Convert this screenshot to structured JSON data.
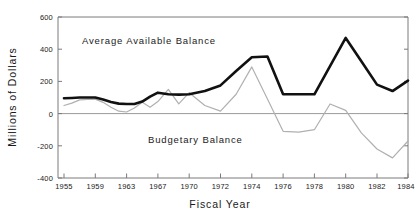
{
  "chart_data": {
    "type": "line",
    "title": "",
    "xlabel": "Fiscal Year",
    "ylabel": "Millions of Dollars",
    "xlim": [
      1955,
      1984
    ],
    "ylim": [
      -400,
      600
    ],
    "grid": false,
    "legend_position": "inline-annotations",
    "y_ticks": [
      600,
      400,
      200,
      0,
      -200,
      -400
    ],
    "y_tick_labels": [
      "600",
      "400",
      "200",
      "0",
      "-200",
      "-400"
    ],
    "x_ticks": [
      1955,
      1959,
      1963,
      1967,
      1970,
      1972,
      1974,
      1976,
      1978,
      1980,
      1982,
      1984
    ],
    "x_tick_labels": [
      "1955",
      "1959",
      "1963",
      "1967",
      "1970",
      "1972",
      "1974",
      "1976",
      "1978",
      "1980",
      "1982",
      "1984"
    ],
    "annotations": [
      {
        "text": "Average Available Balance",
        "x": 1962,
        "y": 400
      },
      {
        "text": "Budgetary Balance",
        "x": 1971,
        "y": -95
      }
    ],
    "series": [
      {
        "name": "Average Available Balance",
        "color": "#111111",
        "width": 2.6,
        "x": [
          1955,
          1959,
          1963,
          1967,
          1970,
          1972,
          1974,
          1976,
          1978,
          1980,
          1982,
          1984
        ],
        "values": [
          95,
          100,
          60,
          130,
          120,
          350,
          355,
          120,
          120,
          470,
          180,
          205
        ]
      },
      {
        "name": "Budgetary Balance",
        "color": "#b0b0b0",
        "width": 1.2,
        "x": [
          1955,
          1959,
          1963,
          1967,
          1970,
          1972,
          1974,
          1976,
          1978,
          1980,
          1982,
          1984
        ],
        "values": [
          50,
          90,
          10,
          75,
          130,
          15,
          290,
          -110,
          -100,
          60,
          -220,
          -170
        ]
      }
    ],
    "series_detailed": [
      {
        "name": "Average Available Balance",
        "points": [
          [
            1955,
            95
          ],
          [
            1956,
            97
          ],
          [
            1957,
            100
          ],
          [
            1958,
            100
          ],
          [
            1959,
            100
          ],
          [
            1960,
            88
          ],
          [
            1961,
            72
          ],
          [
            1962,
            62
          ],
          [
            1963,
            60
          ],
          [
            1964,
            60
          ],
          [
            1965,
            75
          ],
          [
            1966,
            105
          ],
          [
            1967,
            130
          ],
          [
            1968,
            120
          ],
          [
            1969,
            118
          ],
          [
            1970,
            120
          ],
          [
            1971,
            140
          ],
          [
            1972,
            175
          ],
          [
            1973,
            265
          ],
          [
            1974,
            350
          ],
          [
            1975,
            355
          ],
          [
            1976,
            120
          ],
          [
            1977,
            120
          ],
          [
            1978,
            120
          ],
          [
            1979,
            295
          ],
          [
            1980,
            470
          ],
          [
            1981,
            325
          ],
          [
            1982,
            180
          ],
          [
            1983,
            140
          ],
          [
            1984,
            205
          ]
        ]
      },
      {
        "name": "Budgetary Balance",
        "points": [
          [
            1955,
            50
          ],
          [
            1956,
            65
          ],
          [
            1957,
            85
          ],
          [
            1958,
            88
          ],
          [
            1959,
            90
          ],
          [
            1960,
            70
          ],
          [
            1961,
            40
          ],
          [
            1962,
            15
          ],
          [
            1963,
            10
          ],
          [
            1964,
            35
          ],
          [
            1965,
            70
          ],
          [
            1966,
            40
          ],
          [
            1967,
            75
          ],
          [
            1968,
            150
          ],
          [
            1969,
            60
          ],
          [
            1970,
            130
          ],
          [
            1971,
            50
          ],
          [
            1972,
            15
          ],
          [
            1973,
            120
          ],
          [
            1974,
            290
          ],
          [
            1975,
            90
          ],
          [
            1976,
            -110
          ],
          [
            1977,
            -115
          ],
          [
            1978,
            -100
          ],
          [
            1979,
            60
          ],
          [
            1980,
            20
          ],
          [
            1981,
            -120
          ],
          [
            1982,
            -220
          ],
          [
            1983,
            -275
          ],
          [
            1984,
            -170
          ]
        ]
      }
    ]
  },
  "axis": {
    "y_label": "Millions of Dollars",
    "x_label": "Fiscal Year"
  },
  "colors": {
    "primary_series": "#111111",
    "secondary_series": "#b0b0b0",
    "axis": "#7a7a7a",
    "zero_line": "#9a9a9a",
    "text": "#1a1a1a",
    "background": "#ffffff"
  }
}
